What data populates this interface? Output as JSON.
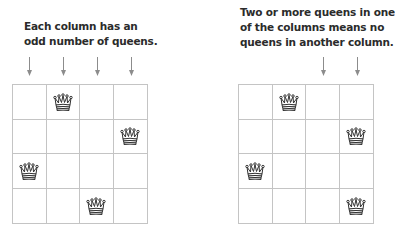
{
  "panels": [
    {
      "caption_lines": [
        "Each column has an",
        "odd number of queens."
      ],
      "arrow_columns": [
        0,
        1,
        2,
        3
      ],
      "queens": [
        {
          "row": 0,
          "col": 1
        },
        {
          "row": 1,
          "col": 3
        },
        {
          "row": 2,
          "col": 0
        },
        {
          "row": 3,
          "col": 2
        }
      ]
    },
    {
      "caption_lines": [
        "Two or more queens in one",
        "of the columns means no",
        "queens in another column."
      ],
      "arrow_columns": [
        2,
        3
      ],
      "queens": [
        {
          "row": 0,
          "col": 1
        },
        {
          "row": 1,
          "col": 3
        },
        {
          "row": 2,
          "col": 0
        },
        {
          "row": 3,
          "col": 3
        }
      ]
    }
  ],
  "grid": {
    "rows": 4,
    "cols": 4
  },
  "icons": {
    "piece": "queen-icon",
    "marker": "arrow-down-icon"
  },
  "colors": {
    "grid_line": "#c4c4c4",
    "arrow": "#8c8c8c",
    "text": "#2b2b2b",
    "queen": "#333333"
  }
}
